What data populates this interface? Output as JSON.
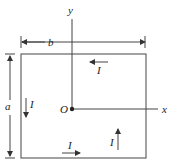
{
  "labels": {
    "y_axis": "y",
    "x_axis": "x",
    "origin": "O",
    "width": "b",
    "height": "a",
    "current": "I"
  },
  "colors": {
    "line": "#333333"
  }
}
